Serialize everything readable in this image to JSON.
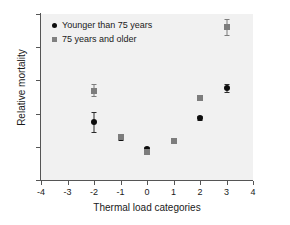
{
  "chart_data": {
    "type": "scatter",
    "title": "",
    "xlabel": "Thermal load categories",
    "ylabel": "Relative mortality",
    "xlim": [
      -4,
      4
    ],
    "ylim": [
      95,
      120
    ],
    "xticks": [
      -4,
      -3,
      -2,
      -1,
      0,
      1,
      2,
      3,
      4
    ],
    "xtick_labels": [
      "-4",
      "-3",
      "-2",
      "-1",
      "0",
      "1",
      "2",
      "3",
      "4"
    ],
    "yticks": [
      95,
      100,
      105,
      110,
      115,
      120
    ],
    "ytick_labels": [
      "95",
      "100",
      "105",
      "110",
      "115",
      "120"
    ],
    "grid": false,
    "legend_position": "top-left",
    "plot_background": "#f1f1f1",
    "series": [
      {
        "name": "Younger than 75 years",
        "marker": "circle",
        "color": "#0d0d0d",
        "x": [
          -2,
          -1,
          0,
          2,
          3
        ],
        "values": [
          103.7,
          101.3,
          99.7,
          104.3,
          108.8
        ],
        "err_low": [
          102.3,
          101.0,
          99.4,
          104.0,
          108.2
        ],
        "err_high": [
          105.2,
          101.7,
          100.0,
          104.6,
          109.5
        ]
      },
      {
        "name": "75 years and older",
        "marker": "square",
        "color": "#7d7d7d",
        "x": [
          -2,
          -1,
          0,
          1,
          2,
          3
        ],
        "values": [
          108.4,
          101.5,
          99.2,
          100.8,
          107.3,
          118.0
        ],
        "err_low": [
          107.6,
          101.2,
          98.9,
          100.6,
          107.1,
          116.8
        ],
        "err_high": [
          109.4,
          101.8,
          99.5,
          101.0,
          107.5,
          119.2
        ]
      }
    ]
  },
  "legend": {
    "items": [
      {
        "label": "Younger than 75 years",
        "marker": "circle"
      },
      {
        "label": "75 years and older",
        "marker": "square"
      }
    ]
  }
}
